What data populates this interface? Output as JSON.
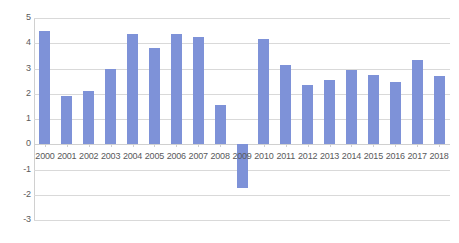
{
  "chart_data": {
    "type": "bar",
    "title": "",
    "subtitle": "",
    "xlabel": "",
    "ylabel": "",
    "categories": [
      "2000",
      "2001",
      "2002",
      "2003",
      "2004",
      "2005",
      "2006",
      "2007",
      "2008",
      "2009",
      "2010",
      "2011",
      "2012",
      "2013",
      "2014",
      "2015",
      "2016",
      "2017",
      "2018"
    ],
    "values": [
      4.5,
      1.9,
      2.1,
      3.0,
      4.35,
      3.8,
      4.35,
      4.25,
      1.55,
      -1.75,
      4.15,
      3.15,
      2.35,
      2.55,
      2.95,
      2.75,
      2.45,
      3.35,
      2.7
    ],
    "series": [
      {
        "name": "",
        "values": [
          4.5,
          1.9,
          2.1,
          3.0,
          4.35,
          3.8,
          4.35,
          4.25,
          1.55,
          -1.75,
          4.15,
          3.15,
          2.35,
          2.55,
          2.95,
          2.75,
          2.45,
          3.35,
          2.7
        ]
      }
    ],
    "ylim": [
      -3,
      5
    ],
    "ytick_labels": [
      "5",
      "4",
      "3",
      "2",
      "1",
      "0",
      "-1",
      "-2",
      "-3"
    ],
    "ytick_values": [
      5,
      4,
      3,
      2,
      1,
      0,
      -1,
      -2,
      -3
    ],
    "grid": true,
    "legend": false,
    "legend_position": "none",
    "annotations": [],
    "bar_color": "#7e92d8",
    "gridline_color": "#d9d9d9",
    "axis_text_color": "#59595b",
    "background_color": "#ffffff"
  }
}
